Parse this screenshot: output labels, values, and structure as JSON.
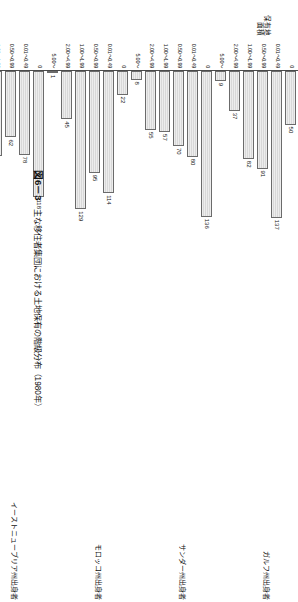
{
  "figure": {
    "number": "図6－3",
    "title": "主な移住者集団における土地保有の階級分布（1980年）"
  },
  "axis": {
    "y_title": "保有地\n面積",
    "ticks": [
      "0",
      "0.01\n～\n0.49",
      "0.50\n～\n0.99",
      "1.00\n～\n1.99",
      "2.00\n～\n4.99",
      "5.00\n～"
    ],
    "ticks_flat": [
      "0",
      "0.01～0.49",
      "0.50～0.99",
      "1.00～1.99",
      "2.00～4.99",
      "5.00～"
    ]
  },
  "chart_data": {
    "type": "bar",
    "title": "主な移住者集団における土地保有の階級分布（1980年）",
    "xlabel": "",
    "ylabel": "保有地面積",
    "orientation": "horizontal",
    "grid": false,
    "legend": "none",
    "categories": [
      "0",
      "0.01～0.49",
      "0.50～0.99",
      "1.00～1.99",
      "2.00～4.99",
      "5.00～"
    ],
    "xlim": [
      0,
      140
    ],
    "series": [
      {
        "name": "ガルフ州出身者",
        "values": [
          50,
          137,
          91,
          82,
          37,
          9
        ]
      },
      {
        "name": "サンダー州出身者",
        "values": [
          136,
          80,
          70,
          57,
          55,
          8
        ]
      },
      {
        "name": "モロッコ州出身者",
        "values": [
          22,
          114,
          95,
          129,
          45,
          1
        ]
      },
      {
        "name": "イーストニューブリア州出身者",
        "values": [
          118,
          78,
          62,
          79,
          58,
          11
        ]
      },
      {
        "name": "国外出身者",
        "values": [
          133,
          81,
          29,
          42,
          94,
          27
        ]
      }
    ]
  }
}
